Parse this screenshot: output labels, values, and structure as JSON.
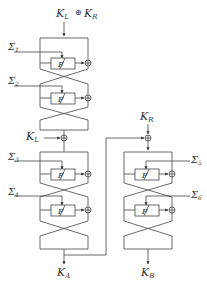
{
  "diagram": {
    "type": "feistel-key-schedule",
    "inputs": {
      "top": "K_L ⊕ K_R",
      "left_mid": "K_L",
      "right_top": "K_R"
    },
    "outputs": {
      "left": "K_A",
      "right": "K_B"
    },
    "round_function_label": "F",
    "sigmas": [
      "Σ1",
      "Σ2",
      "Σ3",
      "Σ4",
      "Σ5",
      "Σ6"
    ],
    "labels": {
      "top_K": "K",
      "top_L": "L",
      "top_op": "⊕",
      "top_K2": "K",
      "top_R": "R",
      "kl_K": "K",
      "kl_L": "L",
      "kr_K": "K",
      "kr_R": "R",
      "ka_K": "K",
      "ka_A": "A",
      "kb_K": "K",
      "kb_B": "B",
      "sigma": "Σ",
      "s1": "1",
      "s2": "2",
      "s3": "3",
      "s4": "4",
      "s5": "5",
      "s6": "6",
      "F": "F"
    },
    "colors": {
      "line": "#444444",
      "text": "#333333",
      "background": "#ffffff"
    }
  }
}
